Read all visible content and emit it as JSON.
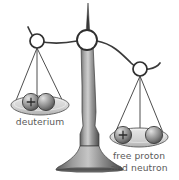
{
  "figure": {
    "type": "illustration-balance-scale",
    "background_color": "#ffffff"
  },
  "labels": {
    "left_pan": "deuterium",
    "right_pan_line1": "free proton",
    "right_pan_line2": "and neutron",
    "text_color": "#5a5a5a"
  },
  "palette": {
    "outline": "#2f2f2f",
    "beam_stroke": "#3a3a3a",
    "column_light": "#b9b9b9",
    "column_mid": "#8a8a8a",
    "column_dark": "#4a4a4a",
    "pan_fill": "#d8d8d8",
    "pan_stroke": "#555555",
    "sphere_light": "#cfcfcf",
    "sphere_mid": "#9a9a9a",
    "sphere_dark": "#5c5c5c",
    "ring_fill": "#ffffff"
  },
  "balance": {
    "state": "tilted-left-pan-lower",
    "pivot": {
      "x": 87,
      "y": 40,
      "radius": 10
    },
    "needle": {
      "top_x": 88,
      "top_y": 3,
      "bottom_x": 87,
      "bottom_y": 40
    },
    "left_hanger_ring": {
      "x": 37,
      "y": 41,
      "radius": 7
    },
    "right_hanger_ring": {
      "x": 140,
      "y": 69,
      "radius": 7
    },
    "column": {
      "top_y": 40,
      "base_y": 170,
      "base_half_width": 27
    }
  },
  "left_pan": {
    "name": "deuterium",
    "pan": {
      "cx": 40,
      "cy": 108,
      "rx": 29,
      "ry": 7
    },
    "particles": [
      {
        "label": "proton",
        "symbol": "+",
        "cx": 31,
        "cy": 103,
        "r": 8.5,
        "has_charge_mark": true
      },
      {
        "label": "neutron",
        "symbol": "",
        "cx": 46,
        "cy": 103,
        "r": 8.5,
        "has_charge_mark": false
      }
    ],
    "arrangement": "touching-bound-pair"
  },
  "right_pan": {
    "name": "free proton and neutron",
    "pan": {
      "cx": 139,
      "cy": 140,
      "rx": 29,
      "ry": 7
    },
    "particles": [
      {
        "label": "proton",
        "symbol": "+",
        "cx": 124,
        "cy": 136,
        "r": 8.5,
        "has_charge_mark": true
      },
      {
        "label": "neutron",
        "symbol": "",
        "cx": 153,
        "cy": 136,
        "r": 8.5,
        "has_charge_mark": false
      }
    ],
    "arrangement": "separated-free-pair"
  }
}
